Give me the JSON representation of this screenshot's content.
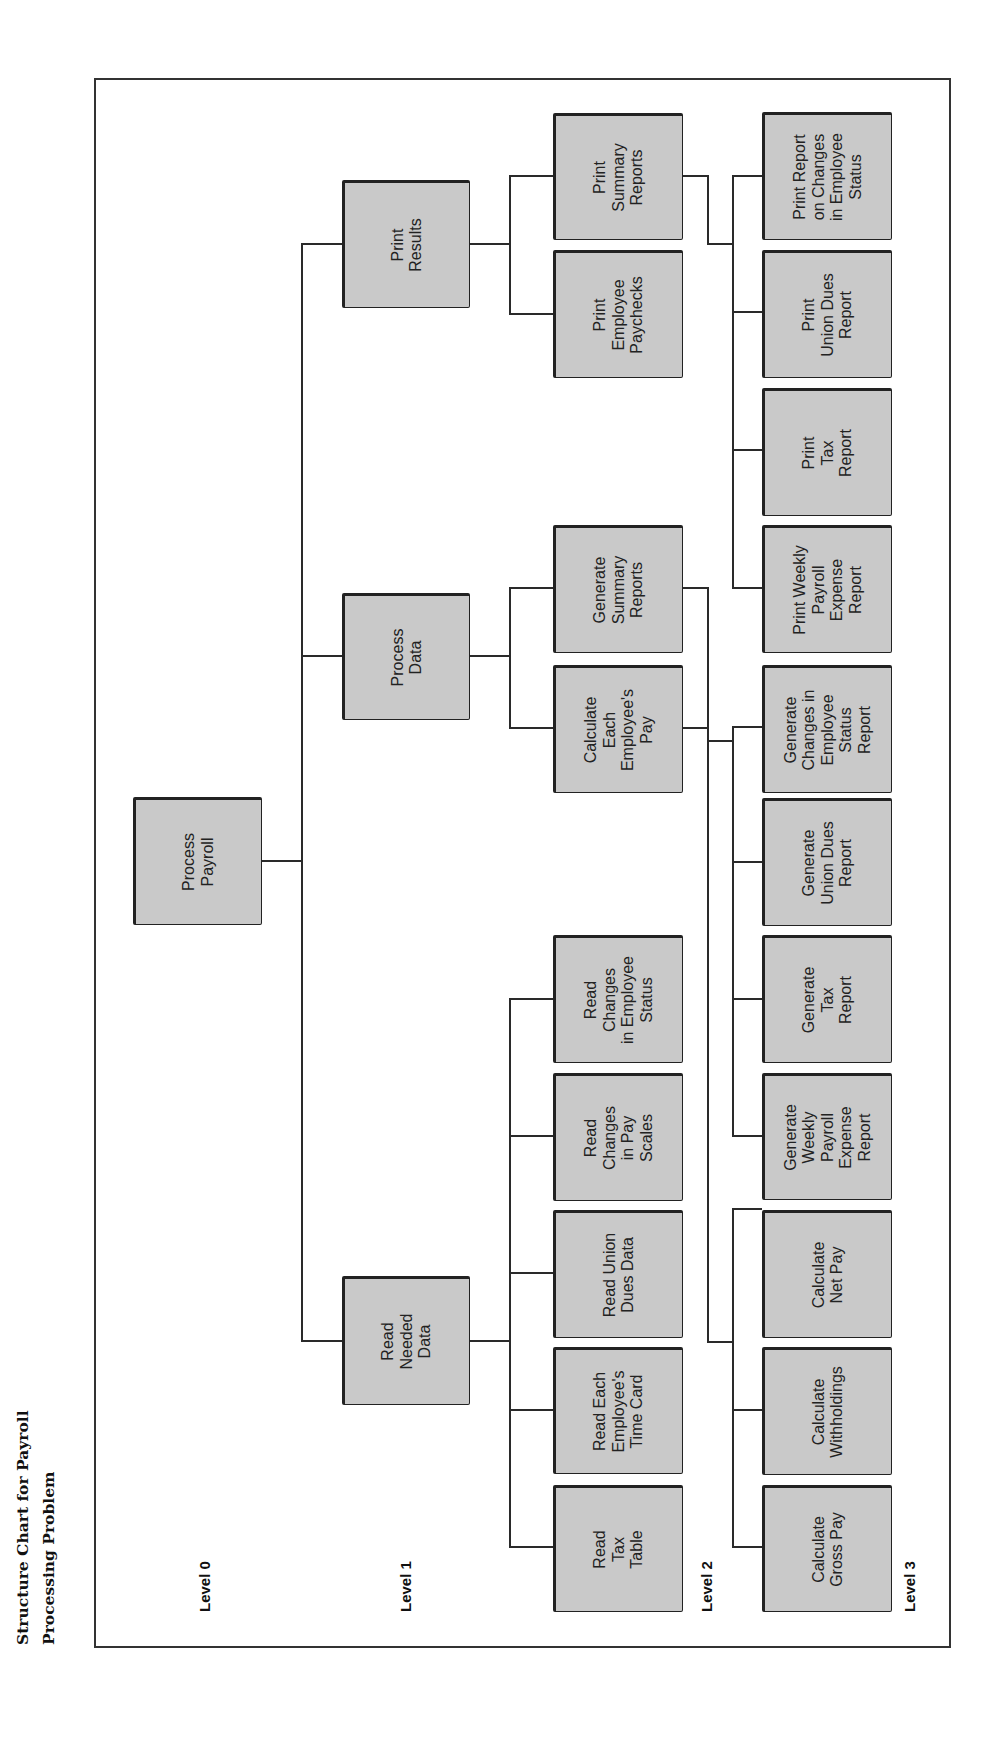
{
  "title": {
    "line1": "Structure Chart for Payroll",
    "line2": "Processing Problem"
  },
  "levels": [
    "Level 0",
    "Level 1",
    "Level 2",
    "Level 3"
  ],
  "colors": {
    "box_fill": "#c9c9c9",
    "box_border": "#222222",
    "line": "#2a2a2a"
  },
  "tree": {
    "root": "Process\nPayroll",
    "level1": {
      "read": "Read\nNeeded\nData",
      "process": "Process\nData",
      "print": "Print\nResults"
    },
    "level2": {
      "read_tax_table": "Read\nTax\nTable",
      "read_time_card": "Read Each\nEmployee's\nTime Card",
      "read_union_dues": "Read Union\nDues Data",
      "read_pay_scales": "Read\nChanges\nin Pay\nScales",
      "read_employee_status": "Read\nChanges\nin Employee\nStatus",
      "calc_employee_pay": "Calculate\nEach\nEmployee's\nPay",
      "gen_summary_reports": "Generate\nSummary\nReports",
      "print_paychecks": "Print\nEmployee\nPaychecks",
      "print_summary_reports": "Print\nSummary\nReports"
    },
    "level3": {
      "calc_gross_pay": "Calculate\nGross Pay",
      "calc_withholdings": "Calculate\nWithholdings",
      "calc_net_pay": "Calculate\nNet Pay",
      "gen_weekly_payroll": "Generate\nWeekly\nPayroll\nExpense\nReport",
      "gen_tax_report": "Generate\nTax\nReport",
      "gen_union_dues": "Generate\nUnion Dues\nReport",
      "gen_status_changes": "Generate\nChanges in\nEmployee\nStatus\nReport",
      "print_weekly_payroll": "Print Weekly\nPayroll\nExpense\nReport",
      "print_tax_report": "Print\nTax\nReport",
      "print_union_dues": "Print\nUnion Dues\nReport",
      "print_status_changes": "Print Report\non Changes\nin Employee\nStatus"
    }
  }
}
